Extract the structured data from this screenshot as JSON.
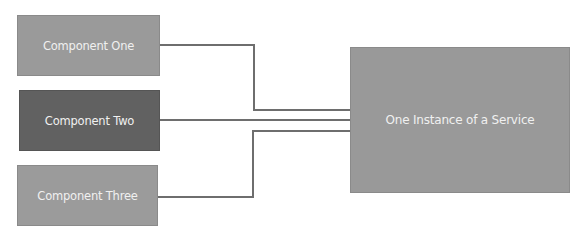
{
  "diagram": {
    "components": [
      {
        "label": "Component One",
        "fill": "#9a9a9a"
      },
      {
        "label": "Component Two",
        "fill": "#616161"
      },
      {
        "label": "Component Three",
        "fill": "#9b9b9b"
      }
    ],
    "service": {
      "label": "One Instance of a Service",
      "fill": "#999999"
    },
    "connector_color": "#6e6e6e",
    "edges": [
      {
        "from": "Component One",
        "to": "One Instance of a Service"
      },
      {
        "from": "Component Two",
        "to": "One Instance of a Service"
      },
      {
        "from": "Component Three",
        "to": "One Instance of a Service"
      }
    ]
  }
}
